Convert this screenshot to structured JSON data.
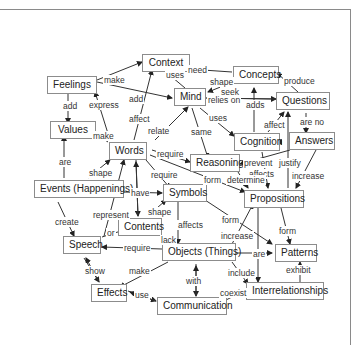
{
  "diagram": {
    "type": "concept-map",
    "nodes": {
      "context": "Context",
      "concepts": "Concepts",
      "feelings": "Feelings",
      "mind": "Mind",
      "questions": "Questions",
      "values": "Values",
      "words": "Words",
      "cognition": "Cognition",
      "answers": "Answers",
      "reasoning": "Reasoning",
      "events": "Events (Happenings)",
      "symbols": "Symbols",
      "propositions": "Propositions",
      "contents": "Contents",
      "speech": "Speech",
      "objects": "Objects (Things)",
      "patterns": "Patterns",
      "effects": "Effects",
      "interrelationships": "Interrelationships",
      "communication": "Communication"
    },
    "edge_labels": {
      "feelings_context_make": "make",
      "context_mind_uses": "uses",
      "concepts_context_need": "need",
      "concepts_mind_shape": "shape",
      "questions_concepts_produce": "produce",
      "mind_questions_seek": "seek",
      "mind_questions_relies_on": "relies on",
      "cognition_concepts_adds": "adds",
      "feelings_values_add": "add",
      "words_feelings_express": "express",
      "feelings_mind_add": "add",
      "words_context_affect": "affect",
      "words_mind_relate": "relate",
      "mind_cognition_uses": "uses",
      "mind_reasoning_same": "same",
      "cognition_questions_affect": "affect",
      "questions_answers_are_no": "are no",
      "answers_questions_follow": "follow",
      "words_values_make": "make",
      "words_reasoning_require": "require",
      "reasoning_cognition_prevent": "prevent",
      "answers_propositions_justify": "justify",
      "cognition_propositions_affects": "affects",
      "answers_propositions_increase": "increase",
      "events_values_are": "are",
      "events_words_shape": "shape",
      "words_symbols_require": "require",
      "words_propositions_form": "form",
      "reasoning_propositions_determine": "determine",
      "events_symbols_have": "have",
      "speech_words_represent": "represent",
      "symbols_contents_shape": "shape",
      "symbols_objects_affects": "affects",
      "symbols_patterns_form": "form",
      "objects_propositions_increase": "increase",
      "propositions_patterns_form": "form",
      "events_speech_create": "create",
      "speech_contents_or": "or",
      "objects_symbols_lack": "lack",
      "objects_speech_require": "require",
      "objects_patterns_are": "are",
      "speech_effects_show": "show",
      "objects_effects_make": "make",
      "objects_interrelationships_include": "include",
      "interrelationships_patterns_exhibit": "exhibit",
      "objects_communication_with": "with",
      "effects_communication_use": "use",
      "communication_interrelationships_coexist": "coexist"
    }
  }
}
